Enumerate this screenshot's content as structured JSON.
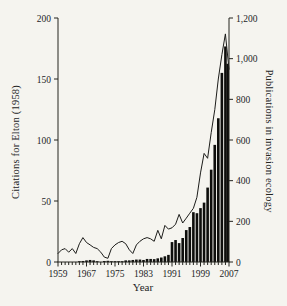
{
  "figure": {
    "background": "#f5f4ef",
    "ink": "#24241f",
    "bar_color": "#0e0e0c",
    "line_color": "#1c1c1a"
  },
  "chart_data": {
    "type": "bar",
    "subtype": "bar-and-line-dual-axis",
    "x": [
      1959,
      1960,
      1961,
      1962,
      1963,
      1964,
      1965,
      1966,
      1967,
      1968,
      1969,
      1970,
      1971,
      1972,
      1973,
      1974,
      1975,
      1976,
      1977,
      1978,
      1979,
      1980,
      1981,
      1982,
      1983,
      1984,
      1985,
      1986,
      1987,
      1988,
      1989,
      1990,
      1991,
      1992,
      1993,
      1994,
      1995,
      1996,
      1997,
      1998,
      1999,
      2000,
      2001,
      2002,
      2003,
      2004,
      2005,
      2006,
      2007
    ],
    "series": [
      {
        "name": "Citations for Elton (1958)",
        "type": "line",
        "axis": "left",
        "values": [
          7,
          10,
          11,
          8,
          11,
          7,
          15,
          20,
          16,
          14,
          12,
          11,
          8,
          4,
          3,
          11,
          14,
          16,
          17,
          15,
          10,
          7,
          14,
          17,
          19,
          20,
          19,
          17,
          26,
          19,
          30,
          27,
          28,
          31,
          39,
          32,
          36,
          40,
          44,
          53,
          73,
          89,
          85,
          106,
          125,
          150,
          170,
          187,
          158
        ]
      },
      {
        "name": "Publications in invasion ecology",
        "type": "bar",
        "axis": "right",
        "values": [
          0,
          0,
          0,
          0,
          0,
          0,
          2,
          5,
          8,
          10,
          8,
          3,
          0,
          5,
          6,
          2,
          3,
          2,
          3,
          8,
          8,
          10,
          12,
          12,
          10,
          15,
          15,
          14,
          18,
          22,
          28,
          35,
          98,
          108,
          93,
          118,
          157,
          172,
          245,
          240,
          265,
          292,
          366,
          454,
          576,
          707,
          930,
          1060,
          975
        ]
      }
    ],
    "left_axis": {
      "label": "Citations for Elton (1958)",
      "range": [
        0,
        200
      ],
      "ticks": [
        0,
        50,
        100,
        150,
        200
      ],
      "tick_labels": [
        "0",
        "50",
        "100",
        "150",
        "200"
      ]
    },
    "right_axis": {
      "label": "Publications in invasion ecology",
      "range": [
        0,
        1200
      ],
      "ticks": [
        0,
        200,
        400,
        600,
        800,
        1000,
        1200
      ],
      "tick_labels": [
        "0",
        "200",
        "400",
        "600",
        "800",
        "1,000",
        "1,200"
      ]
    },
    "x_axis": {
      "label": "Year",
      "range": [
        1959,
        2007
      ],
      "labeled_ticks": [
        1959,
        1967,
        1975,
        1983,
        1991,
        1999,
        2007
      ],
      "labeled_tick_labels": [
        "1959",
        "1967",
        "1975",
        "1983",
        "1991",
        "1999",
        "2007"
      ],
      "minor_tick_interval": 1
    },
    "grid": false,
    "legend": "none"
  }
}
